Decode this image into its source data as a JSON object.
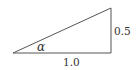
{
  "diagram": {
    "type": "right-triangle",
    "angle_label": "α",
    "side_labels": {
      "adjacent": "1.0",
      "opposite": "0.5"
    },
    "stroke_color": "#555555",
    "text_color": "#333333"
  }
}
